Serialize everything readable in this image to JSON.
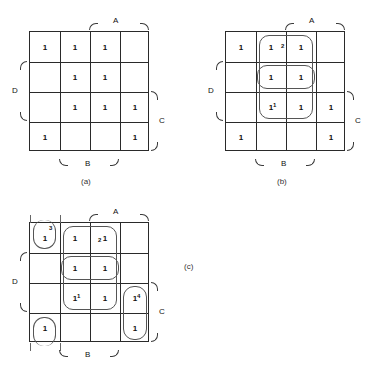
{
  "figure": {
    "variables": [
      "A",
      "B",
      "C",
      "D"
    ],
    "cell_value": "1",
    "maps": [
      {
        "id": "a",
        "caption": "(a)",
        "origin": {
          "x": 29,
          "y": 31
        },
        "axis_labels": {
          "top": "A",
          "bottom": "B",
          "left": "D",
          "right": "C"
        },
        "ones": [
          [
            1,
            1,
            1,
            0
          ],
          [
            0,
            1,
            1,
            0
          ],
          [
            0,
            1,
            1,
            1
          ],
          [
            1,
            0,
            0,
            1
          ]
        ],
        "groups": []
      },
      {
        "id": "b",
        "caption": "(b)",
        "origin": {
          "x": 225,
          "y": 31
        },
        "axis_labels": {
          "top": "A",
          "bottom": "B",
          "left": "D",
          "right": "C"
        },
        "ones": [
          [
            1,
            1,
            1,
            0
          ],
          [
            0,
            1,
            1,
            0
          ],
          [
            0,
            1,
            1,
            1
          ],
          [
            1,
            0,
            0,
            1
          ]
        ],
        "groups": [
          {
            "tag": "2",
            "col": 2,
            "row": 0,
            "cols": 1,
            "rows": 3,
            "tag_pos": "inner-right-top"
          },
          {
            "tag": "1",
            "col": 1,
            "row": 1,
            "cols": 2,
            "rows": 1,
            "tag_pos": "none"
          },
          {
            "tag": "1",
            "col": 1,
            "row": 2,
            "cols": 1,
            "rows": 1,
            "tag_pos": "inner-right-bottom"
          }
        ]
      },
      {
        "id": "c",
        "caption": "(c)",
        "origin": {
          "x": 29,
          "y": 222
        },
        "axis_labels": {
          "top": "A",
          "bottom": "B",
          "left": "D",
          "right": "C"
        },
        "ones": [
          [
            1,
            1,
            1,
            0
          ],
          [
            0,
            1,
            1,
            0
          ],
          [
            0,
            1,
            1,
            1
          ],
          [
            1,
            0,
            0,
            1
          ]
        ],
        "groups": [
          {
            "tag": "3",
            "col": 0,
            "row": 0,
            "cols": 1,
            "rows": 1,
            "tag_pos": "corner-top"
          },
          {
            "tag": "2",
            "col": 2,
            "row": 0,
            "cols": 1,
            "rows": 3,
            "tag_pos": "inner-right-top"
          },
          {
            "tag": "1",
            "col": 1,
            "row": 1,
            "cols": 2,
            "rows": 1,
            "tag_pos": "none"
          },
          {
            "tag": "1",
            "col": 1,
            "row": 2,
            "cols": 1,
            "rows": 1,
            "tag_pos": "inner-right-bottom"
          },
          {
            "tag": "4",
            "col": 3,
            "row": 2,
            "cols": 1,
            "rows": 2,
            "tag_pos": "inner-right-top"
          },
          {
            "tag": "",
            "col": 0,
            "row": 3,
            "cols": 1,
            "rows": 1,
            "tag_pos": "none"
          }
        ]
      }
    ]
  }
}
